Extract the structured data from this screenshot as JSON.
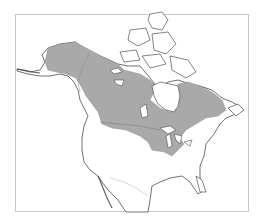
{
  "map": {
    "region": "North America",
    "type": "species range map",
    "colors": {
      "background": "#ffffff",
      "frame": "#c8c8c8",
      "land_fill": "#ffffff",
      "coastline": "#333333",
      "border_line": "#999999",
      "range_fill": "#a9a9a9"
    },
    "range_shaded": "boreal Canada and Alaska, extending to the Great Lakes region",
    "legend": null
  }
}
